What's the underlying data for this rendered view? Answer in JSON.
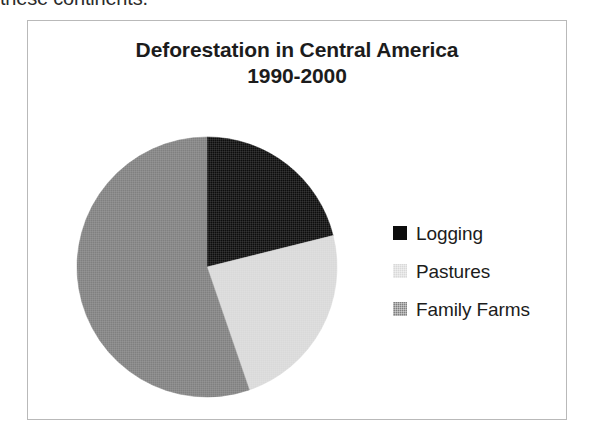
{
  "page": {
    "cropped_paragraph_text": "these continents."
  },
  "figure": {
    "border_color": "#b9b9b9",
    "background": "#ffffff"
  },
  "chart_data": {
    "type": "pie",
    "title": "Deforestation in Central America",
    "title_line1": "Deforestation in Central America",
    "title_line2": "1990-2000",
    "subtitle": "1990-2000",
    "xlabel": "",
    "ylabel": "",
    "legend_position": "right",
    "grid": false,
    "start_angle_deg": 0,
    "direction": "clockwise",
    "categories": [
      "Logging",
      "Pastures",
      "Family Farms"
    ],
    "values": [
      21,
      24,
      55
    ],
    "units": "percent",
    "colors": [
      "#0d0d0d",
      "#d9d9d9",
      "#808080"
    ],
    "slices": [
      {
        "label": "Logging",
        "value": 21,
        "color": "#0d0d0d",
        "start_deg": 0,
        "end_deg": 76
      },
      {
        "label": "Pastures",
        "value": 24,
        "color": "#d9d9d9",
        "start_deg": 76,
        "end_deg": 161
      },
      {
        "label": "Family Farms",
        "value": 55,
        "color": "#808080",
        "start_deg": 161,
        "end_deg": 360
      }
    ]
  },
  "legend": {
    "items": [
      {
        "label": "Logging",
        "color": "#0d0d0d",
        "dithered": false
      },
      {
        "label": "Pastures",
        "color": "#d9d9d9",
        "dithered": true
      },
      {
        "label": "Family Farms",
        "color": "#808080",
        "dithered": true
      }
    ]
  }
}
